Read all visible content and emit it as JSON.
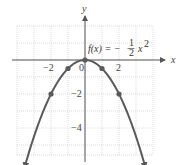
{
  "chart_data": {
    "type": "line",
    "title": "",
    "function_label": {
      "lhs": "f(x) = −",
      "frac_num": "1",
      "frac_den": "2",
      "var": "x",
      "exp": "2"
    },
    "xlabel": "x",
    "ylabel": "y",
    "xlim": [
      -4,
      4
    ],
    "ylim": [
      -5.6,
      2
    ],
    "grid": true,
    "x_ticks": [
      {
        "value": -2,
        "label": "−2"
      },
      {
        "value": 0,
        "label": "0"
      },
      {
        "value": 2,
        "label": "2"
      }
    ],
    "y_ticks": [
      {
        "value": -2,
        "label": "−2"
      },
      {
        "value": -4,
        "label": "−4"
      }
    ],
    "series": [
      {
        "name": "f(x) = -1/2 x^2",
        "expression": "-0.5*x^2",
        "domain": [
          -3.55,
          3.55
        ],
        "arrows_at_ends": true,
        "color": "#5a5a5a",
        "marked_points": [
          {
            "x": -2,
            "y": -2
          },
          {
            "x": -1,
            "y": -0.5
          },
          {
            "x": 0,
            "y": 0
          },
          {
            "x": 1,
            "y": -0.5
          },
          {
            "x": 2,
            "y": -2
          }
        ]
      }
    ]
  },
  "labels": {
    "x_axis": "x",
    "y_axis": "y",
    "tick_neg2_x": "−2",
    "tick_0": "0",
    "tick_2_x": "2",
    "tick_neg2_y": "−2",
    "tick_neg4_y": "−4",
    "func_lhs": "f(x) = −",
    "func_num": "1",
    "func_den": "2",
    "func_var": "x",
    "func_exp": "2"
  }
}
